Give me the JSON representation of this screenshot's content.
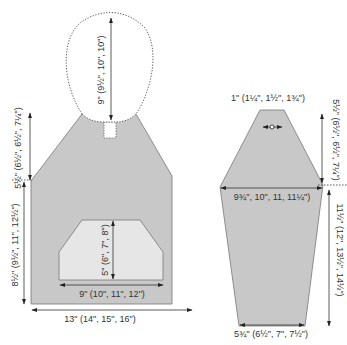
{
  "diagram": {
    "type": "knitting-schematic",
    "colors": {
      "piece_fill": "#c8c8c8",
      "pocket_fill": "#e6e6e6",
      "outline": "#777777",
      "text": "#333333"
    },
    "body": {
      "name": "Body (front/back) with hood",
      "hood_height": "9\" (9½\", 10\", 10\")",
      "armhole_depth": "5½\" (6½\", 6½\", 7¼\")",
      "length_to_armhole": "8½\" (9½\", 11\", 12½\")",
      "pocket_height": "5\" (6\", 7\", 8\")",
      "pocket_width": "9\" (10\", 11\", 12\")",
      "width": "13\" (14\", 15\", 16\")"
    },
    "sleeve": {
      "name": "Sleeve",
      "top_width": "1\" (1¼\", 1½\", 1¾\")",
      "cap_height": "5½\" (6½\", 6½\", 7¼\")",
      "upper_width": "9¾\", 10\", 11, 11¼\")",
      "length": "11½\" (12\", 13½\", 14½\")",
      "cuff_width": "5¾\" (6½\", 7\", 7½\")"
    }
  }
}
